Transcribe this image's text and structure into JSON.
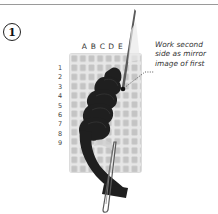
{
  "step": {
    "number": "1"
  },
  "grid": {
    "columns": [
      "A",
      "B",
      "C",
      "D",
      "E"
    ],
    "rows": [
      "1",
      "2",
      "3",
      "4",
      "5",
      "6",
      "7",
      "8",
      "9"
    ]
  },
  "callout": {
    "lines": [
      "Work second",
      "side as mirror",
      "image of first"
    ]
  },
  "colors": {
    "rule": "#9a9a9a",
    "canvas": "#d4d4d4",
    "canvas_hole": "#bdbdbd",
    "yarn": "#1e1e1e",
    "needle": "#555555",
    "text": "#333333"
  }
}
